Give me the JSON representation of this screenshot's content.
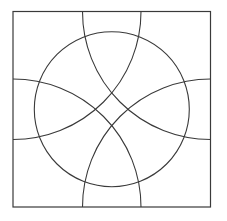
{
  "canvas": {
    "width": 226,
    "height": 221,
    "background_color": "#ffffff"
  },
  "figure": {
    "stroke_color": "#3a3a3a",
    "stroke_width": 1.1,
    "fill": "none"
  },
  "chart_data": {
    "type": "diagram",
    "title": "",
    "xlabel": "",
    "ylabel": "",
    "grid": false,
    "legend": "none",
    "xlim": [
      0,
      226
    ],
    "ylim": [
      0,
      221
    ],
    "shapes": [
      {
        "name": "outer-square",
        "kind": "rect",
        "x": 13,
        "y": 11.5,
        "width": 197.5,
        "height": 195.5,
        "stroke": "#3a3a3a",
        "stroke_width": 1.2,
        "fill": "none"
      },
      {
        "name": "inscribed-circle",
        "kind": "circle",
        "cx": 111.8,
        "cy": 109.2,
        "r": 77.5,
        "stroke": "#3a3a3a",
        "stroke_width": 1.1,
        "fill": "none"
      },
      {
        "name": "corner-arc-top-left",
        "kind": "circle",
        "cx": 13,
        "cy": 11.5,
        "r": 128,
        "stroke": "#3a3a3a",
        "stroke_width": 1.1,
        "fill": "none",
        "clip": "outer-square"
      },
      {
        "name": "corner-arc-top-right",
        "kind": "circle",
        "cx": 210.5,
        "cy": 11.5,
        "r": 128,
        "stroke": "#3a3a3a",
        "stroke_width": 1.1,
        "fill": "none",
        "clip": "outer-square"
      },
      {
        "name": "corner-arc-bottom-left",
        "kind": "circle",
        "cx": 13,
        "cy": 207,
        "r": 128,
        "stroke": "#3a3a3a",
        "stroke_width": 1.1,
        "fill": "none",
        "clip": "outer-square"
      },
      {
        "name": "corner-arc-bottom-right",
        "kind": "circle",
        "cx": 210.5,
        "cy": 207,
        "r": 128,
        "stroke": "#3a3a3a",
        "stroke_width": 1.1,
        "fill": "none",
        "clip": "outer-square"
      }
    ],
    "annotations": []
  }
}
